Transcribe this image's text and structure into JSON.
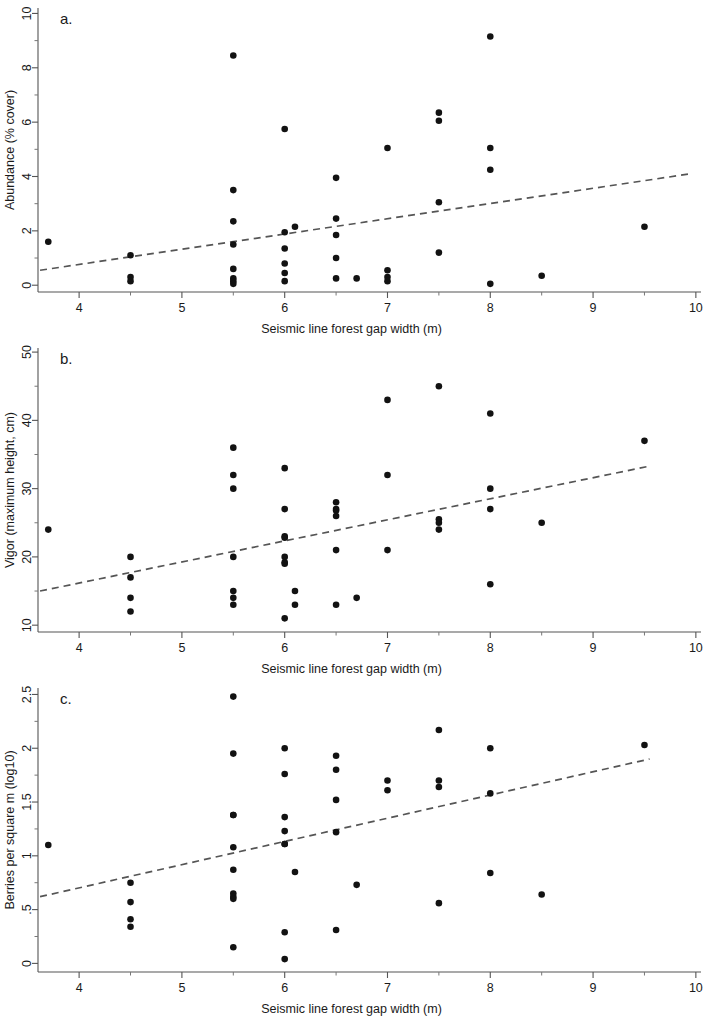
{
  "figure": {
    "width": 705,
    "height": 1025,
    "background": "#ffffff",
    "point_color": "#121212",
    "axis_color": "#555555",
    "fit_line_color": "#555555",
    "shared_xlabel": "Seismic line forest gap width (m)"
  },
  "panels": [
    {
      "id": "a",
      "letter": "a.",
      "ylabel": "Abundance (% cover)",
      "xlabel": "Seismic line forest gap width (m)"
    },
    {
      "id": "b",
      "letter": "b.",
      "ylabel": "Vigor (maximum height, cm)",
      "xlabel": "Seismic line forest gap width (m)"
    },
    {
      "id": "c",
      "letter": "c.",
      "ylabel": "Berries per square m (log10)",
      "xlabel": "Seismic line forest gap width (m)"
    }
  ],
  "chart_data": [
    {
      "type": "scatter",
      "panel": "a",
      "title": "",
      "xlabel": "Seismic line forest gap width (m)",
      "ylabel": "Abundance (% cover)",
      "xlim": [
        3.6,
        10.05
      ],
      "ylim": [
        -0.25,
        10.2
      ],
      "xticks": [
        4,
        5,
        6,
        7,
        8,
        9,
        10
      ],
      "xticklabels": [
        "4",
        "5",
        "6",
        "7",
        "8",
        "9",
        "10"
      ],
      "xminorticks": [
        4.5,
        5.5,
        6.5,
        7.5,
        8.5,
        9.5
      ],
      "yticks": [
        0,
        2,
        4,
        6,
        8,
        10
      ],
      "yticklabels": [
        "0",
        "2",
        "4",
        "6",
        "8",
        "10"
      ],
      "yminorticks": [
        1,
        3,
        5,
        7,
        9
      ],
      "grid": false,
      "legend": null,
      "x": [
        3.7,
        4.5,
        4.5,
        4.5,
        5.5,
        5.5,
        5.5,
        5.5,
        5.5,
        5.5,
        5.5,
        5.5,
        6.0,
        6.0,
        6.0,
        6.0,
        6.0,
        6.0,
        6.1,
        6.5,
        6.5,
        6.5,
        6.5,
        6.5,
        6.7,
        7.0,
        7.0,
        7.0,
        7.0,
        7.5,
        7.5,
        7.5,
        7.5,
        8.0,
        8.0,
        8.0,
        8.0,
        8.5,
        9.5
      ],
      "y": [
        1.6,
        1.1,
        0.3,
        0.15,
        8.45,
        3.5,
        2.35,
        1.5,
        0.6,
        0.25,
        0.15,
        0.05,
        5.75,
        1.95,
        1.35,
        0.8,
        0.45,
        0.15,
        2.15,
        3.95,
        2.45,
        1.85,
        1.0,
        0.25,
        0.25,
        5.05,
        0.55,
        0.3,
        0.15,
        6.35,
        6.05,
        3.05,
        1.2,
        9.15,
        5.05,
        4.25,
        0.05,
        0.35,
        2.15
      ],
      "fit_line": {
        "x0": 3.62,
        "y0": 0.55,
        "x1": 9.95,
        "y1": 4.1,
        "style": "dashed"
      }
    },
    {
      "type": "scatter",
      "panel": "b",
      "title": "",
      "xlabel": "Seismic line forest gap width (m)",
      "ylabel": "Vigor (maximum height, cm)",
      "xlim": [
        3.6,
        10.05
      ],
      "ylim": [
        9.0,
        50.6
      ],
      "xticks": [
        4,
        5,
        6,
        7,
        8,
        9,
        10
      ],
      "xticklabels": [
        "4",
        "5",
        "6",
        "7",
        "8",
        "9",
        "10"
      ],
      "xminorticks": [
        4.5,
        5.5,
        6.5,
        7.5,
        8.5,
        9.5
      ],
      "yticks": [
        10,
        20,
        30,
        40,
        50
      ],
      "yticklabels": [
        "10",
        "20",
        "30",
        "40",
        "50"
      ],
      "yminorticks": [
        15,
        25,
        35,
        45
      ],
      "grid": false,
      "legend": null,
      "x": [
        3.7,
        4.5,
        4.5,
        4.5,
        4.5,
        5.5,
        5.5,
        5.5,
        5.5,
        5.5,
        5.5,
        5.5,
        6.0,
        6.0,
        6.0,
        6.0,
        6.0,
        6.0,
        6.0,
        6.0,
        6.1,
        6.1,
        6.5,
        6.5,
        6.5,
        6.5,
        6.5,
        6.5,
        6.7,
        7.0,
        7.0,
        7.0,
        7.5,
        7.5,
        7.5,
        7.5,
        8.0,
        8.0,
        8.0,
        8.0,
        8.5,
        9.5
      ],
      "y": [
        24.0,
        20.0,
        17.0,
        14.0,
        12.0,
        36.0,
        32.0,
        30.0,
        20.0,
        15.0,
        14.0,
        13.0,
        33.0,
        27.0,
        23.0,
        22.8,
        20.0,
        19.2,
        19.0,
        11.0,
        15.0,
        13.0,
        28.0,
        27.0,
        26.8,
        26.0,
        21.0,
        13.0,
        14.0,
        43.0,
        32.0,
        21.0,
        45.0,
        25.5,
        25.0,
        24.0,
        41.0,
        30.0,
        27.0,
        16.0,
        25.0,
        37.0
      ],
      "fit_line": {
        "x0": 3.62,
        "y0": 15.0,
        "x1": 9.55,
        "y1": 33.3,
        "style": "dashed"
      }
    },
    {
      "type": "scatter",
      "panel": "c",
      "title": "",
      "xlabel": "Seismic line forest gap width (m)",
      "ylabel": "Berries per square m (log10)",
      "xlim": [
        3.6,
        10.05
      ],
      "ylim": [
        -0.08,
        2.56
      ],
      "xticks": [
        4,
        5,
        6,
        7,
        8,
        9,
        10
      ],
      "xticklabels": [
        "4",
        "5",
        "6",
        "7",
        "8",
        "9",
        "10"
      ],
      "xminorticks": [
        4.5,
        5.5,
        6.5,
        7.5,
        8.5,
        9.5
      ],
      "yticks": [
        0,
        0.5,
        1,
        1.5,
        2,
        2.5
      ],
      "yticklabels": [
        "0",
        ".5",
        "1",
        "1.5",
        "2",
        "2.5"
      ],
      "yminorticks": [
        0.25,
        0.75,
        1.25,
        1.75,
        2.25
      ],
      "grid": false,
      "legend": null,
      "x": [
        3.7,
        4.5,
        4.5,
        4.5,
        4.5,
        5.5,
        5.5,
        5.5,
        5.5,
        5.5,
        5.5,
        5.5,
        5.5,
        5.5,
        5.5,
        6.0,
        6.0,
        6.0,
        6.0,
        6.0,
        6.0,
        6.0,
        6.0,
        6.1,
        6.5,
        6.5,
        6.5,
        6.5,
        6.5,
        6.7,
        7.0,
        7.0,
        7.5,
        7.5,
        7.5,
        7.5,
        8.0,
        8.0,
        8.0,
        8.5,
        9.5
      ],
      "y": [
        1.1,
        0.75,
        0.57,
        0.41,
        0.34,
        2.48,
        1.95,
        1.38,
        1.08,
        0.87,
        0.65,
        0.62,
        0.6,
        0.15,
        1.38,
        2.0,
        1.76,
        1.36,
        1.23,
        1.11,
        0.29,
        0.04,
        1.11,
        0.85,
        1.93,
        1.8,
        1.52,
        1.22,
        0.31,
        0.73,
        1.7,
        1.61,
        2.17,
        1.7,
        1.64,
        0.56,
        2.0,
        1.58,
        0.84,
        0.64,
        2.03
      ],
      "fit_line": {
        "x0": 3.62,
        "y0": 0.62,
        "x1": 9.55,
        "y1": 1.9,
        "style": "dashed"
      }
    }
  ]
}
